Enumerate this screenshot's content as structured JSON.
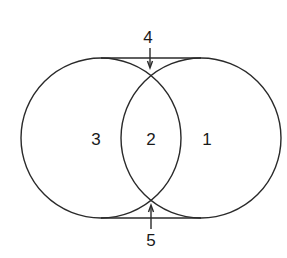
{
  "diagram": {
    "type": "two-circle-overlap",
    "stroke_color": "#2a2a2a",
    "background": "#ffffff",
    "circles": [
      {
        "name": "left-circle",
        "cx": 101,
        "cy": 138,
        "r": 80
      },
      {
        "name": "right-circle",
        "cx": 201,
        "cy": 138,
        "r": 80
      }
    ],
    "tangent_lines": [
      {
        "name": "top-tangent-line",
        "x1": 101,
        "y1": 58,
        "x2": 201,
        "y2": 58
      },
      {
        "name": "bottom-tangent-line",
        "x1": 101,
        "y1": 218,
        "x2": 201,
        "y2": 218
      }
    ],
    "regions": [
      {
        "id": "1",
        "label": "1",
        "x": 207,
        "y": 139
      },
      {
        "id": "2",
        "label": "2",
        "x": 151,
        "y": 139
      },
      {
        "id": "3",
        "label": "3",
        "x": 96,
        "y": 139
      },
      {
        "id": "4",
        "label": "4",
        "x": 148,
        "y": 37
      },
      {
        "id": "5",
        "label": "5",
        "x": 151,
        "y": 240
      }
    ],
    "arrows": [
      {
        "name": "arrow-4",
        "x": 150,
        "y_from": 48,
        "y_to": 67,
        "direction": "down"
      },
      {
        "name": "arrow-5",
        "x": 151,
        "y_from": 229,
        "y_to": 206,
        "direction": "up"
      }
    ]
  }
}
